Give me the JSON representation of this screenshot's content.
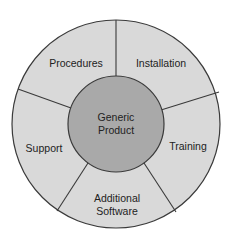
{
  "diagram": {
    "center": {
      "line1": "Generic",
      "line2": "Product"
    },
    "segments": [
      {
        "label": "Installation"
      },
      {
        "label": "Training"
      },
      {
        "label1": "Additional",
        "label2": "Software"
      },
      {
        "label": "Support"
      },
      {
        "label": "Procedures"
      }
    ],
    "colors": {
      "outer_ring": "#d9d9d9",
      "center": "#a9a9a9",
      "stroke": "#3a3a3a"
    }
  }
}
